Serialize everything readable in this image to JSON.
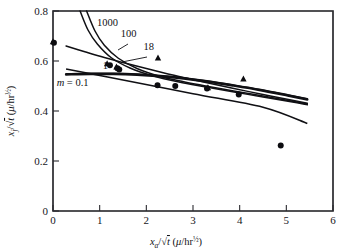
{
  "figure": {
    "background_color": "#ffffff",
    "ink_color": "#101014"
  },
  "chart_data": {
    "type": "scatter",
    "title": "",
    "subtitle": "",
    "xlabel": "xₐ/√t (μ/hr½)",
    "ylabel": "xⱼ/√t (μ/hr½)",
    "xlabel_parts": {
      "var": "x",
      "var_sub": "a",
      "denom": "t",
      "units_open": "(",
      "units_num": "μ",
      "units_slash": "/",
      "units_den": "hr",
      "units_exp": "½",
      "units_close": ")"
    },
    "ylabel_parts": {
      "var": "x",
      "var_sub": "j",
      "denom": "t",
      "units_open": "(",
      "units_num": "μ",
      "units_slash": "/",
      "units_den": "hr",
      "units_exp": "½",
      "units_close": ")"
    },
    "xlim": [
      0,
      6
    ],
    "ylim": [
      0,
      0.8
    ],
    "xticks": [
      0,
      1,
      2,
      3,
      4,
      5,
      6
    ],
    "xtick_labels": [
      "0",
      "1",
      "2",
      "3",
      "4",
      "5",
      "6"
    ],
    "yticks": [
      0,
      0.2,
      0.4,
      0.6,
      0.8
    ],
    "ytick_labels": [
      "0",
      "0.2",
      "0.4",
      "0.6",
      "0.8"
    ],
    "grid": false,
    "legend_position": "inline-curve-labels",
    "series": [
      {
        "name": "circle-data",
        "marker": "filled-circle",
        "points": [
          {
            "x": 0.02,
            "y": 0.673
          },
          {
            "x": 1.22,
            "y": 0.583
          },
          {
            "x": 1.38,
            "y": 0.571
          },
          {
            "x": 1.42,
            "y": 0.566
          },
          {
            "x": 2.24,
            "y": 0.503
          },
          {
            "x": 2.62,
            "y": 0.5
          },
          {
            "x": 3.3,
            "y": 0.49
          },
          {
            "x": 3.98,
            "y": 0.466
          },
          {
            "x": 4.88,
            "y": 0.262
          }
        ]
      },
      {
        "name": "triangle-data",
        "marker": "filled-triangle",
        "points": [
          {
            "x": 0.0,
            "y": 0.676
          },
          {
            "x": 1.16,
            "y": 0.588
          },
          {
            "x": 1.36,
            "y": 0.575
          },
          {
            "x": 2.25,
            "y": 0.611
          },
          {
            "x": 3.32,
            "y": 0.492
          },
          {
            "x": 4.08,
            "y": 0.527
          }
        ]
      }
    ],
    "curves": [
      {
        "label": "1000",
        "m_value": "1000",
        "points": [
          {
            "x": 0.72,
            "y": 0.8
          },
          {
            "x": 0.9,
            "y": 0.72
          },
          {
            "x": 1.1,
            "y": 0.663
          },
          {
            "x": 1.4,
            "y": 0.611
          },
          {
            "x": 1.8,
            "y": 0.57
          },
          {
            "x": 2.3,
            "y": 0.538
          },
          {
            "x": 2.8,
            "y": 0.517
          },
          {
            "x": 3.3,
            "y": 0.499
          },
          {
            "x": 3.9,
            "y": 0.479
          },
          {
            "x": 4.5,
            "y": 0.46
          },
          {
            "x": 5.1,
            "y": 0.44
          },
          {
            "x": 5.45,
            "y": 0.428
          }
        ]
      },
      {
        "label": "100",
        "m_value": "100",
        "points": [
          {
            "x": 0.58,
            "y": 0.8
          },
          {
            "x": 0.75,
            "y": 0.724
          },
          {
            "x": 0.95,
            "y": 0.668
          },
          {
            "x": 1.25,
            "y": 0.613
          },
          {
            "x": 1.65,
            "y": 0.572
          },
          {
            "x": 2.15,
            "y": 0.54
          },
          {
            "x": 2.7,
            "y": 0.516
          },
          {
            "x": 3.25,
            "y": 0.497
          },
          {
            "x": 3.85,
            "y": 0.477
          },
          {
            "x": 4.5,
            "y": 0.456
          },
          {
            "x": 5.1,
            "y": 0.437
          },
          {
            "x": 5.45,
            "y": 0.425
          }
        ]
      },
      {
        "label": "18",
        "m_value": "18",
        "points": [
          {
            "x": 0.28,
            "y": 0.66
          },
          {
            "x": 0.7,
            "y": 0.636
          },
          {
            "x": 1.1,
            "y": 0.614
          },
          {
            "x": 1.6,
            "y": 0.589
          },
          {
            "x": 2.15,
            "y": 0.563
          },
          {
            "x": 2.7,
            "y": 0.538
          },
          {
            "x": 3.25,
            "y": 0.515
          },
          {
            "x": 3.85,
            "y": 0.491
          },
          {
            "x": 4.5,
            "y": 0.466
          },
          {
            "x": 5.1,
            "y": 0.444
          },
          {
            "x": 5.45,
            "y": 0.431
          }
        ]
      },
      {
        "label": "1",
        "m_value": "1",
        "points": [
          {
            "x": 0.28,
            "y": 0.549
          },
          {
            "x": 0.8,
            "y": 0.551
          },
          {
            "x": 1.3,
            "y": 0.551
          },
          {
            "x": 1.8,
            "y": 0.548
          },
          {
            "x": 2.3,
            "y": 0.542
          },
          {
            "x": 2.8,
            "y": 0.533
          },
          {
            "x": 3.3,
            "y": 0.521
          },
          {
            "x": 3.85,
            "y": 0.505
          },
          {
            "x": 4.45,
            "y": 0.486
          },
          {
            "x": 5.05,
            "y": 0.464
          },
          {
            "x": 5.45,
            "y": 0.449
          }
        ]
      },
      {
        "label": "m = 0.1",
        "m_value": "0.1",
        "heavy": true,
        "points": [
          {
            "x": 0.28,
            "y": 0.546
          },
          {
            "x": 0.8,
            "y": 0.548
          },
          {
            "x": 1.3,
            "y": 0.548
          },
          {
            "x": 1.8,
            "y": 0.545
          },
          {
            "x": 2.3,
            "y": 0.539
          },
          {
            "x": 2.8,
            "y": 0.53
          },
          {
            "x": 3.3,
            "y": 0.518
          },
          {
            "x": 3.85,
            "y": 0.502
          },
          {
            "x": 4.45,
            "y": 0.483
          },
          {
            "x": 5.05,
            "y": 0.461
          },
          {
            "x": 5.45,
            "y": 0.446
          }
        ]
      },
      {
        "label": "data-fit",
        "m_value": "",
        "points": [
          {
            "x": 0.28,
            "y": 0.568
          },
          {
            "x": 1.5,
            "y": 0.524
          },
          {
            "x": 3.0,
            "y": 0.469
          },
          {
            "x": 4.5,
            "y": 0.415
          },
          {
            "x": 5.45,
            "y": 0.35
          }
        ]
      }
    ],
    "annotations": [
      {
        "name": "label-1000",
        "text": "1000",
        "x": 1.17,
        "y": 0.757
      },
      {
        "name": "label-100",
        "text": "100",
        "x": 1.62,
        "y": 0.711
      },
      {
        "name": "label-18",
        "text": "18",
        "x": 2.05,
        "y": 0.661
      },
      {
        "name": "label-1",
        "text": "1",
        "x": 1.12,
        "y": 0.583
      },
      {
        "name": "label-m",
        "text": "m = 0.1",
        "x": 0.42,
        "y": 0.518
      }
    ]
  }
}
